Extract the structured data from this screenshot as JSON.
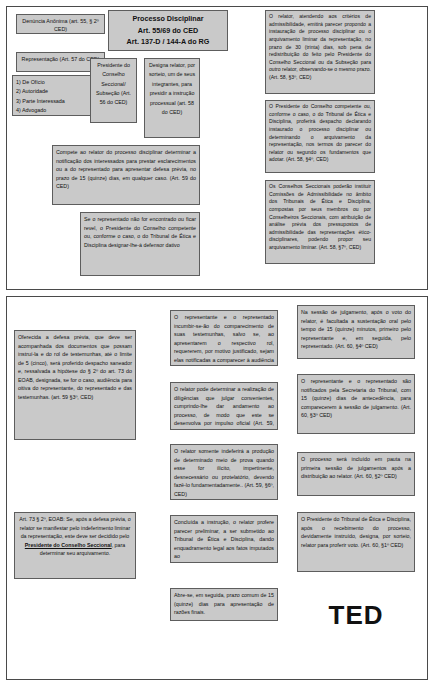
{
  "document": {
    "title": "Fluxograma do Processo Disciplinar - CED / EOAB",
    "panels": [
      "painel-superior",
      "painel-inferior"
    ]
  },
  "top": {
    "denuncia": "Denúncia Anônima (art. 55, § 2º CED)",
    "representacao": "Representação (Art. 57 do CED)",
    "legitimados": "1) De Ofício\n2) Autoridade\n3) Parte  Interessada\n4) Advogado\n(Prov. 83/96)",
    "processo_titulo": "Processo Disciplinar\nArt. 55/69 do CED\nArt. 137-D / 144-A do RG\nArt. 70 / 77 do EOAB",
    "presidente": "Presidente do Conselho Seccional/ Subseção (Art. 56 do CED)",
    "designa_relator": "Designa relator, por sorteio, um de seus integrantes, para presidir a instrução processual (art. 58 do CED)",
    "compete_relator": "Compete ao relator do processo disciplinar determinar a notificação dos interessados para prestar esclarecimentos ou a do representado para apresentar defesa prévia, no prazo de 15 (quinze) dias, em qualquer caso. (Art. 59 do CED)",
    "revel": "Se o representado não for encontrado ou ficar revel, o Presidente do Conselho competente ou, conforme o caso, o do Tribunal de Ética e Disciplina designar-lhe-á defensor dativo",
    "parecer_admissibilidade": "O relator, atendendo aos critérios de admissibilidade, emitirá parecer propondo a instauração de processo disciplinar ou o arquivamento liminar da representação, no prazo de 30 (trinta) dias, sob pena de redistribuição do feito pelo Presidente do Conselho Seccional ou da Subseção para outro relator, observando-se o mesmo prazo. (Art. 58, §3º, CED)",
    "despacho_presidente": "O Presidente do Conselho competente ou, conforme o caso, o do Tribunal de Ética e Disciplina, proferirá despacho declarando instaurado o processo disciplinar ou determinando o arquivamento da representação, nos termos do parecer do relator ou segundo os fundamentos que adotar. (Art. 58, §4º, CED)",
    "comissoes": "Os Conselhos Seccionais poderão instituir Comissões de Admissibilidade no âmbito dos Tribunais de Ética e Disciplina, compostas por seus membros ou por Conselheiros Seccionais, com atribuição de análise prévia dos pressupostos de admissibilidade das representações ético-disciplinares, podendo propor seu arquivamento liminar. (Art. 58, §7º, CED)"
  },
  "bottom": {
    "defesa_previa": "Oferecida a defesa prévia, que deve ser acompanhada dos documentos que possam instruí-la e do rol de testemunhas, até o limite de 5 (cinco), será proferido despacho saneador e, ressalvada a hipótese do § 2º do art. 73 do EOAB, designada, se for o caso, audiência para oitiva do representante, do representado e das testemunhas. (art. 59 §3º, CED)",
    "indeferimento": "Art. 73 § 2º, EOAB:  Se, após a defesa prévia, o relator se manifestar pelo indeferimento liminar da representação, este deve ser decidido pelo Presidente do Conselho Seccional, para determinar seu arquivamento.",
    "indeferimento_destaque": "Presidente do Conselho Seccional",
    "comparecimento": "O representante e o representado incumbir-se-ão do comparecimento de suas testemunhas, salvo se, ao apresentarem o respectivo rol, requererem, por motivo justificado, sejam elas notificadas a comparecer à audiência de instrução do processo. (Art. 59, §4º, CED)",
    "diligencias": "O relator pode determinar a realização de diligências que julgar convenientes, cumprindo-lhe dar andamento ao processo, de modo que este se desenvolva por impulso oficial (Art. 59, §5º, CED)",
    "indeferir_prova": "O relator somente indeferirá a produção de determinado meio de prova quando esse for ilícito, impertinente, desnecessário ou protelatório, devendo fazê-lo fundamentadamente.. (Art. 59, §6º, CED)",
    "parecer_preliminar": "Concluída a instrução, o relator profere parecer preliminar, a ser submetido ao Tribunal de Ética e Disciplina, dando enquadramento legal aos fatos imputados ao",
    "razoes_finais": "Abre-se, em seguida, prazo comum de 15 (quinze) dias para apresentação de razões finais.",
    "sustentacao_oral": "Na sessão de julgamento, após o voto do relator, é facultada a sustentação oral pelo tempo de 15 (quinze) minutos, primeiro pelo representante e, em seguida, pelo representado. (Art. 60, §4º CED)",
    "notificacao_sessao": "O representante e o representado são notificados pela Secretaria do Tribunal, com 15 (quinze) dias de antecedência, para comparecerem à sessão de julgamento. (Art. 60, §3º CED)",
    "pauta": "O processo será incluído em pauta na primeira sessão de julgamentos após a distribuição ao relator. (Art. 60, §2º CED)",
    "recebimento": "O Presidente do Tribunal de Ética e Disciplina, após o recebimento do processo, devidamente instruído, designa, por sorteio, relator para proferir voto. (Art. 60, §1º CED)",
    "ted": "TED"
  }
}
